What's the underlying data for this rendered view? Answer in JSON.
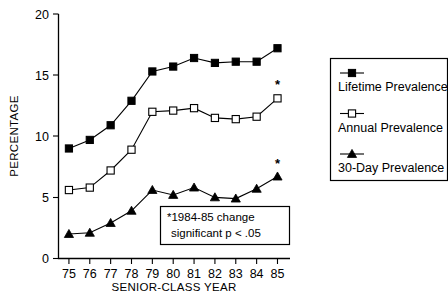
{
  "chart_data": {
    "type": "line",
    "title": "",
    "xlabel": "SENIOR-CLASS YEAR",
    "ylabel": "PERCENTAGE",
    "categories": [
      "75",
      "76",
      "77",
      "78",
      "79",
      "80",
      "81",
      "82",
      "83",
      "84",
      "85"
    ],
    "x": [
      75,
      76,
      77,
      78,
      79,
      80,
      81,
      82,
      83,
      84,
      85
    ],
    "xlim": [
      74.5,
      85.6
    ],
    "ylim": [
      0,
      20
    ],
    "yticks": [
      "0",
      "5",
      "10",
      "15",
      "20"
    ],
    "ytick_values": [
      0,
      5,
      10,
      15,
      20
    ],
    "grid": false,
    "legend_position": "right",
    "series": [
      {
        "name": "Lifetime Prevalence",
        "marker": "filled-square",
        "values": [
          9.0,
          9.7,
          10.9,
          12.9,
          15.3,
          15.7,
          16.4,
          16.0,
          16.1,
          16.1,
          17.2
        ]
      },
      {
        "name": "Annual Prevalence",
        "marker": "open-square",
        "values": [
          5.6,
          5.8,
          7.2,
          8.9,
          12.0,
          12.1,
          12.3,
          11.5,
          11.4,
          11.6,
          13.1
        ]
      },
      {
        "name": "30-Day Prevalence",
        "marker": "filled-triangle",
        "values": [
          2.0,
          2.1,
          2.9,
          3.9,
          5.6,
          5.2,
          5.8,
          5.0,
          4.9,
          5.7,
          6.7
        ]
      }
    ],
    "annotations": [
      {
        "name": "significance-note",
        "line1": "*1984-85 change",
        "line2": "significant  p < .05"
      },
      {
        "name": "star-annual-85",
        "text": "*",
        "series": "Annual Prevalence",
        "x": 85
      },
      {
        "name": "star-30day-85",
        "text": "*",
        "series": "30-Day Prevalence",
        "x": 85
      }
    ],
    "colors": {
      "line": "#000000",
      "marker_fill": "#000000",
      "marker_open_fill": "#ffffff",
      "background": "#ffffff"
    }
  },
  "legend": {
    "items": [
      {
        "label": "Lifetime Prevalence",
        "marker": "filled-square"
      },
      {
        "label": "Annual Prevalence",
        "marker": "open-square"
      },
      {
        "label": "30-Day Prevalence",
        "marker": "filled-triangle"
      }
    ]
  }
}
